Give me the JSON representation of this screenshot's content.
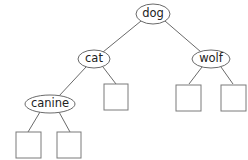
{
  "diagram": {
    "type": "binary-search-tree",
    "nodes": {
      "root": {
        "label": "dog"
      },
      "left": {
        "label": "cat"
      },
      "right": {
        "label": "wolf"
      },
      "left_left": {
        "label": "canine"
      }
    },
    "empty_leaves": [
      "canine-left",
      "canine-right",
      "cat-right",
      "wolf-left",
      "wolf-right"
    ],
    "colors": {
      "stroke": "#6a6a6a",
      "text": "#222222",
      "background": "#ffffff"
    }
  }
}
